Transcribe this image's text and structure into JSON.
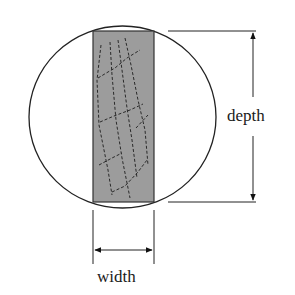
{
  "diagram": {
    "labels": {
      "depth": "depth",
      "width": "width"
    },
    "colors": {
      "background": "#ffffff",
      "outline": "#222222",
      "timber_fill": "#9c9c9c",
      "grain_lines": "#2a2a2a"
    },
    "shapes": {
      "log_circle": {
        "cx": 122.5,
        "cy": 117,
        "rx": 93.5,
        "ry": 91
      },
      "timber_rect": {
        "x": 93,
        "y": 31,
        "width": 61,
        "height": 171
      }
    },
    "dimensions": [
      {
        "name": "depth",
        "orientation": "vertical",
        "from": 31,
        "to": 202,
        "at_x": 253
      },
      {
        "name": "width",
        "orientation": "horizontal",
        "from": 93,
        "to": 154,
        "at_y": 250
      }
    ]
  }
}
